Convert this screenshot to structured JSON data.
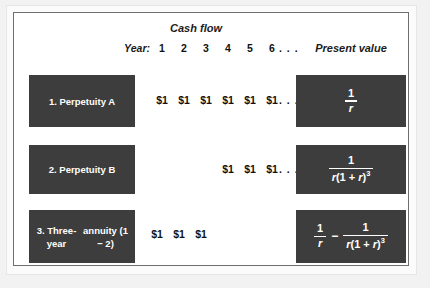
{
  "figure": {
    "headers": {
      "cash_flow": "Cash flow",
      "present_value": "Present value",
      "year": "Year:"
    },
    "year_ticks": [
      "1",
      "2",
      "3",
      "4",
      "5",
      "6"
    ],
    "year_ellipsis": ". . .",
    "cash_amount": "$1",
    "cash_ellipsis": ". . .",
    "rows": [
      {
        "label": "1. Perpetuity A",
        "cash_flows": [
          "$1",
          "$1",
          "$1",
          "$1",
          "$1",
          "$1"
        ],
        "has_ellipsis": true,
        "present_value_text": "1 / r",
        "formula": {
          "terms": [
            {
              "numerator": "1",
              "denominator": "r"
            }
          ],
          "operator": ""
        }
      },
      {
        "label": "2. Perpetuity B",
        "cash_flows": [
          "$1",
          "$1",
          "$1"
        ],
        "has_ellipsis": true,
        "present_value_text": "1 / r(1 + r)^3",
        "formula": {
          "terms": [
            {
              "numerator": "1",
              "denominator": "r(1 + r)3"
            }
          ],
          "operator": ""
        }
      },
      {
        "label": "3. Three-year annuity (1 − 2)",
        "label_line1": "3. Three-year",
        "label_line2": "annuity (1 − 2)",
        "cash_flows": [
          "$1",
          "$1",
          "$1"
        ],
        "has_ellipsis": false,
        "present_value_text": "1 / r − 1 / r(1 + r)^3",
        "formula": {
          "terms": [
            {
              "numerator": "1",
              "denominator": "r"
            },
            {
              "numerator": "1",
              "denominator": "r(1 + r)3"
            }
          ],
          "operator": "−"
        }
      }
    ],
    "colors": {
      "box_fill": "#3d3d3d",
      "box_text": "#ffffff",
      "page_text": "#111111",
      "frame_border": "#6e6e6e",
      "page_background": "#ffffff",
      "outer_background": "#f2f2f2"
    }
  }
}
